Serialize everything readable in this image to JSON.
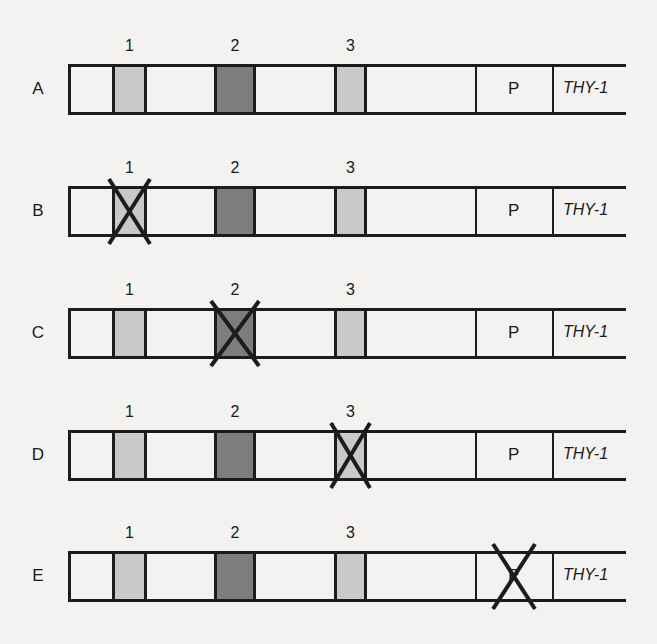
{
  "diagram": {
    "colors": {
      "line": "#1c1c1c",
      "region_light": "#c9c9c9",
      "region_dark": "#7d7d7d",
      "background": "#f3f2f0"
    },
    "region_labels": [
      "1",
      "2",
      "3"
    ],
    "promoter_label": "P",
    "gene_label": "THY-1",
    "constructs": [
      {
        "label": "A",
        "deleted": null
      },
      {
        "label": "B",
        "deleted": "1"
      },
      {
        "label": "C",
        "deleted": "2"
      },
      {
        "label": "D",
        "deleted": "3"
      },
      {
        "label": "E",
        "deleted": "P"
      }
    ]
  }
}
